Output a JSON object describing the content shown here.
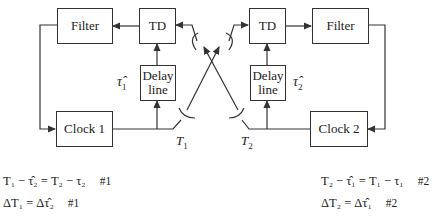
{
  "diagram": {
    "left": {
      "filter_label": "Filter",
      "td_label": "TD",
      "delay_line_1": "Delay",
      "delay_line_2": "line",
      "clock_label": "Clock 1",
      "tau_hat_symbol": "τ̂",
      "tau_hat_sub": "1",
      "antenna_label": "T",
      "antenna_sub": "1"
    },
    "right": {
      "filter_label": "Filter",
      "td_label": "TD",
      "delay_line_1": "Delay",
      "delay_line_2": "line",
      "clock_label": "Clock 2",
      "tau_hat_symbol": "τ̂",
      "tau_hat_sub": "2",
      "antenna_label": "T",
      "antenna_sub": "2"
    }
  },
  "equations": {
    "left": [
      {
        "text": "T₁ − τ̂₂ = T₂ − τ₂",
        "tag": "#1"
      },
      {
        "text": "ΔT₁ = Δτ̂₂",
        "tag": "#1"
      }
    ],
    "right": [
      {
        "text": "T₂ − τ̂₁ = T₁ − τ₁",
        "tag": "#2"
      },
      {
        "text": "ΔT₂ = Δτ̂₁",
        "tag": "#2"
      }
    ]
  },
  "colors": {
    "line": "#333333",
    "background": "#ffffff"
  }
}
